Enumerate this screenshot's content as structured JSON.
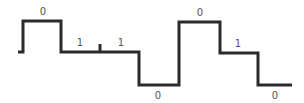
{
  "diagram": {
    "type": "multilevel-signal-waveform",
    "stroke_color": "#2b2b2b",
    "label_color": "#555555",
    "labels": [
      {
        "text": "0",
        "x": 43,
        "y": 15
      },
      {
        "text": "1",
        "x": 80,
        "y": 46
      },
      {
        "text": "1",
        "x": 121,
        "y": 46
      },
      {
        "text": "0",
        "x": 158,
        "y": 99
      },
      {
        "text": "0",
        "x": 200,
        "y": 16
      },
      {
        "text": "1",
        "x": 238,
        "y": 47
      },
      {
        "text": "0",
        "x": 275,
        "y": 99
      }
    ],
    "bits": [
      "0",
      "1",
      "1",
      "0",
      "0",
      "1",
      "0"
    ]
  }
}
